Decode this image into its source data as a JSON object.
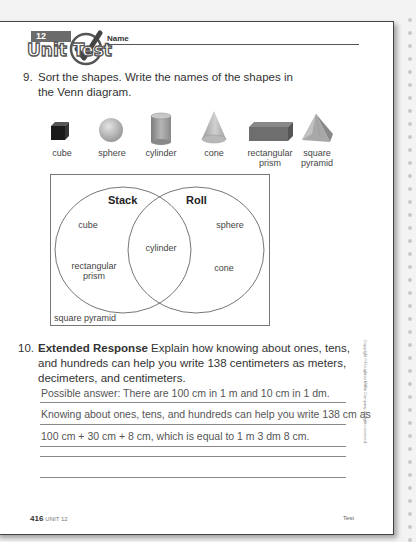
{
  "header": {
    "unit_number": "12",
    "unit_title": "Unit Test",
    "name_label": "Name"
  },
  "question9": {
    "number": "9.",
    "line1": "Sort the shapes. Write the names of the shapes in",
    "line2": "the Venn diagram.",
    "shapes": [
      {
        "icon": "cube-icon",
        "label": "cube"
      },
      {
        "icon": "sphere-icon",
        "label": "sphere"
      },
      {
        "icon": "cylinder-icon",
        "label": "cylinder"
      },
      {
        "icon": "cone-icon",
        "label": "cone"
      },
      {
        "icon": "rectangular-prism-icon",
        "label_line1": "rectangular",
        "label_line2": "prism"
      },
      {
        "icon": "square-pyramid-icon",
        "label_line1": "square",
        "label_line2": "pyramid"
      }
    ],
    "venn": {
      "left_title": "Stack",
      "right_title": "Roll",
      "left_only": [
        "cube",
        "rectangular",
        "prism"
      ],
      "intersection": [
        "cylinder"
      ],
      "right_only": [
        "sphere",
        "cone"
      ],
      "outside": [
        "square pyramid"
      ]
    }
  },
  "question10": {
    "number": "10.",
    "prefix": "Extended Response",
    "line1": " Explain how knowing about ones, tens,",
    "line2": "and hundreds can help you write 138 centimeters as meters,",
    "line3": "decimeters, and centimeters.",
    "answers": [
      "Possible answer: There are 100 cm in 1 m and 10 cm in 1 dm.",
      "Knowing about ones, tens, and hundreds can help you write 138 cm as",
      "100 cm + 30 cm + 8 cm, which is equal to 1 m 3 dm 8 cm.",
      "",
      ""
    ]
  },
  "footer": {
    "page_number": "416",
    "unit_label": "UNIT 12",
    "right_label": "Test"
  },
  "copyright": "Copyright © Houghton Mifflin Company. All rights reserved."
}
